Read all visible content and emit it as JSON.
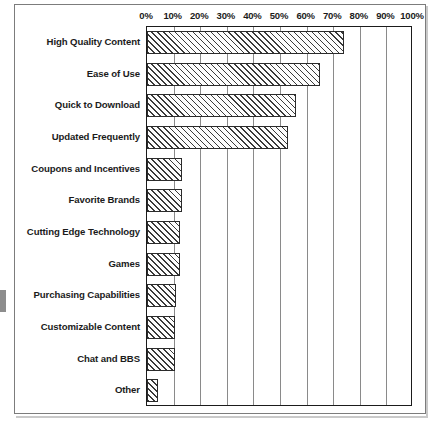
{
  "chart_data": {
    "type": "bar",
    "orientation": "horizontal",
    "title": "",
    "xlabel": "",
    "ylabel": "",
    "xlim": [
      0,
      100
    ],
    "grid": true,
    "legend": null,
    "tick_labels": [
      "0%",
      "10%",
      "20%",
      "30%",
      "40%",
      "50%",
      "60%",
      "70%",
      "80%",
      "90%",
      "100%"
    ],
    "tick_values": [
      0,
      10,
      20,
      30,
      40,
      50,
      60,
      70,
      80,
      90,
      100
    ],
    "categories": [
      "High Quality Content",
      "Ease of Use",
      "Quick to Download",
      "Updated Frequently",
      "Coupons and Incentives",
      "Favorite Brands",
      "Cutting Edge Technology",
      "Games",
      "Purchasing Capabilities",
      "Customizable Content",
      "Chat and BBS",
      "Other"
    ],
    "values": [
      74,
      65,
      56,
      53,
      13,
      13,
      12.5,
      12.5,
      11,
      10.5,
      10.5,
      4
    ],
    "bar_fill": "diagonal-hatch",
    "bar_edge_color": "#2b2b2b",
    "axis_color": "#1b1b1b",
    "gridline_color": "#8a8a8a"
  }
}
